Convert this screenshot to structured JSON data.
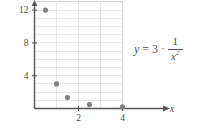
{
  "figure": {
    "kind": "scatter-plot-with-equation",
    "background_color": "#ffffff",
    "ink_color": "#4c4c4c",
    "grid_color": "#d9d9d9",
    "point_color": "#808080"
  },
  "equation": {
    "lhs": "y",
    "relation": "=",
    "coefficient": "3",
    "operator": "·",
    "numerator": "1",
    "denominator_base": "x",
    "denominator_exponent": "2",
    "plain": "y = 3 · 1/x²"
  },
  "chart_data": {
    "type": "scatter",
    "title": "",
    "xlabel": "x",
    "ylabel": "",
    "xlim": [
      0,
      4.4
    ],
    "ylim": [
      0,
      13.5
    ],
    "grid": true,
    "x_ticks": [
      2,
      4
    ],
    "x_tick_labels": [
      "2",
      "4"
    ],
    "y_ticks": [
      4,
      8,
      12
    ],
    "y_tick_labels": [
      "4",
      "8",
      "12"
    ],
    "x_gridlines": [
      1,
      2,
      3,
      4
    ],
    "y_gridlines": [
      1,
      2,
      3,
      4,
      5,
      6,
      7,
      8,
      9,
      10,
      11,
      12,
      13
    ],
    "legend": null,
    "series": [
      {
        "name": "y = 3/x^2",
        "marker": "filled-circle",
        "color": "#808080",
        "points": [
          {
            "x": 0.5,
            "y": 12
          },
          {
            "x": 1,
            "y": 3
          },
          {
            "x": 1.5,
            "y": 1.33
          },
          {
            "x": 2.5,
            "y": 0.48
          },
          {
            "x": 4,
            "y": 0.19
          }
        ]
      }
    ]
  },
  "axes": {
    "x_axis_name": "x-axis",
    "y_axis_name": "y-axis",
    "x_axis_arrow": true,
    "y_axis_arrow": true,
    "x_axis_label": "x"
  }
}
